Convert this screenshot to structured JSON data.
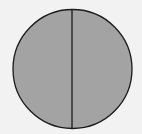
{
  "diagram": {
    "shape": "circle",
    "divided_by": "vertical-line",
    "parts": 2,
    "colors": {
      "background": "#f2f2f2",
      "fill": "#a3a3a3",
      "stroke": "#1a1a1a"
    }
  }
}
